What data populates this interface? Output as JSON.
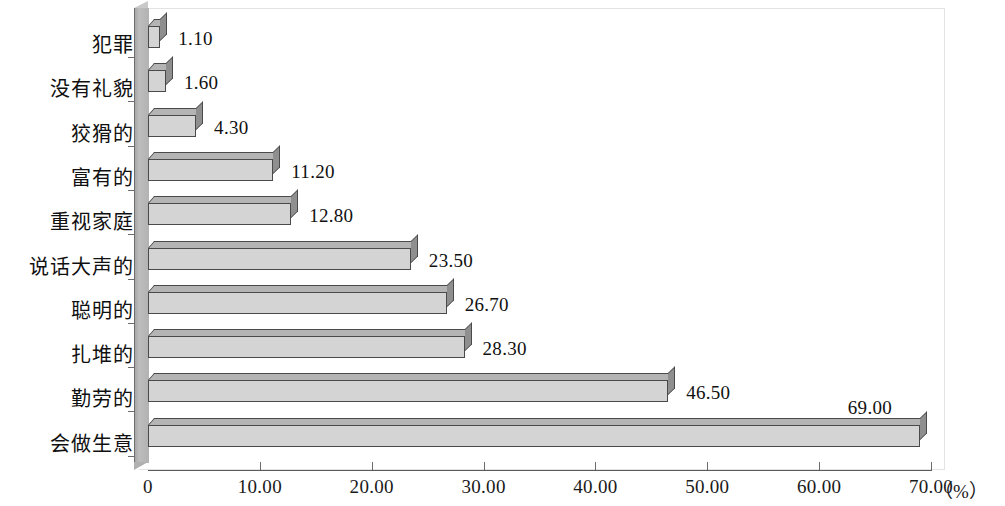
{
  "chart_data": {
    "type": "bar",
    "orientation": "horizontal",
    "title": "",
    "xlabel": "（%）",
    "ylabel": "",
    "xlim": [
      0,
      70
    ],
    "grid": false,
    "legend": null,
    "categories": [
      "犯罪",
      "没有礼貌",
      "狡猾的",
      "富有的",
      "重视家庭",
      "说话大声的",
      "聪明的",
      "扎堆的",
      "勤劳的",
      "会做生意"
    ],
    "values": [
      1.1,
      1.6,
      4.3,
      11.2,
      12.8,
      23.5,
      26.7,
      28.3,
      46.5,
      69.0
    ],
    "value_labels": [
      "1.10",
      "1.60",
      "4.30",
      "11.20",
      "12.80",
      "23.50",
      "26.70",
      "28.30",
      "46.50",
      "69.00"
    ],
    "xticks": [
      0,
      10,
      20,
      30,
      40,
      50,
      60,
      70
    ],
    "xtick_labels": [
      "0",
      "10.00",
      "20.00",
      "30.00",
      "40.00",
      "50.00",
      "60.00",
      "70.00"
    ],
    "unit_label": "（%）",
    "colors": {
      "bar_face": "#d4d4d4",
      "bar_top": "#b4b4b4",
      "bar_side": "#8f8f8f",
      "bar_outline": "#4a4a4a",
      "axis": "#5a5a5a",
      "wall": "#b2b2b2",
      "text": "#111111",
      "background": "#ffffff",
      "frame": "#e3e3e3"
    }
  }
}
